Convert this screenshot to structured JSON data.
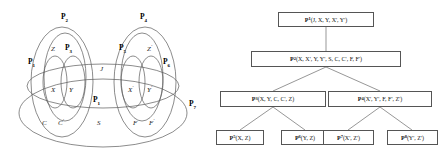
{
  "figure": {
    "caption": "",
    "colors": {
      "stroke": "#555555",
      "text": "#111111",
      "background": "#ffffff"
    }
  },
  "venn": {
    "title": "",
    "set_labels": [
      {
        "name": "P2",
        "text": "P",
        "sub": "2"
      },
      {
        "name": "P4",
        "text": "P",
        "sub": "4"
      },
      {
        "name": "P3",
        "text": "P",
        "sub": "3"
      },
      {
        "name": "P1",
        "text": "P",
        "sub": "1"
      },
      {
        "name": "P5",
        "text": "P",
        "sub": "5"
      },
      {
        "name": "P6",
        "text": "P",
        "sub": "6"
      },
      {
        "name": "P7",
        "text": "P",
        "sub": "7"
      }
    ],
    "regions": [
      {
        "name": "Z",
        "text": "Z",
        "prime": ""
      },
      {
        "name": "Zprime",
        "text": "Z",
        "prime": "'"
      },
      {
        "name": "J",
        "text": "J",
        "prime": ""
      },
      {
        "name": "X",
        "text": "X",
        "prime": ""
      },
      {
        "name": "Y",
        "text": "Y",
        "prime": ""
      },
      {
        "name": "Xprime",
        "text": "X",
        "prime": "'"
      },
      {
        "name": "Yprime",
        "text": "Y",
        "prime": "'"
      },
      {
        "name": "C",
        "text": "C",
        "prime": ""
      },
      {
        "name": "Cprime",
        "text": "C",
        "prime": "'"
      },
      {
        "name": "S",
        "text": "S",
        "prime": ""
      },
      {
        "name": "F",
        "text": "F",
        "prime": ""
      },
      {
        "name": "Fprime",
        "text": "F",
        "prime": "'"
      }
    ]
  },
  "tree": {
    "nodes": [
      {
        "id": "root",
        "name": "P",
        "sub": "1",
        "args": "(J, X, Y, X', Y')"
      },
      {
        "id": "n2",
        "name": "P",
        "sub": "2",
        "args": "(X, X', Y, Y', S, C, C', F, F')"
      },
      {
        "id": "n3",
        "name": "P",
        "sub": "3",
        "args": "(X, Y, C, C', Z)"
      },
      {
        "id": "n4",
        "name": "P",
        "sub": "4",
        "args": "(X', Y', F, F', Z')"
      },
      {
        "id": "leaf1",
        "name": "P",
        "sub": "5",
        "args": "(X, Z)"
      },
      {
        "id": "leaf2",
        "name": "P",
        "sub": "6",
        "args": "(Y, Z)"
      },
      {
        "id": "leaf3",
        "name": "P",
        "sub": "7",
        "args": "(X', Z')"
      },
      {
        "id": "leaf4",
        "name": "P",
        "sub": "8",
        "args": "(Y', Z')"
      }
    ]
  }
}
